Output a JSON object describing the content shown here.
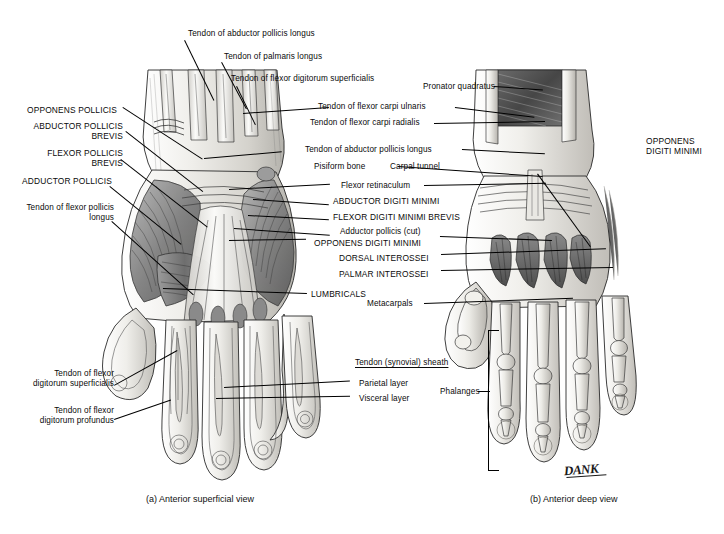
{
  "figure": {
    "signature": "DANK",
    "captions": {
      "a": "(a) Anterior superficial view",
      "b": "(b) Anterior deep view"
    }
  },
  "labels_left_panel": [
    {
      "id": "opponens-pollicis",
      "text": "OPPONENS POLLICIS",
      "style": "caps"
    },
    {
      "id": "abductor-pollicis-brevis",
      "text": "ABDUCTOR POLLICIS BREVIS",
      "style": "caps"
    },
    {
      "id": "flexor-pollicis-brevis",
      "text": "FLEXOR POLLICIS BREVIS",
      "style": "caps"
    },
    {
      "id": "adductor-pollicis",
      "text": "ADDUCTOR POLLICIS",
      "style": "caps"
    },
    {
      "id": "tendon-flexor-pollicis-longus",
      "text": "Tendon of flexor pollicis longus",
      "style": "sentence"
    },
    {
      "id": "tendon-fds",
      "text": "Tendon of flexor digitorum superficialis",
      "style": "sentence"
    },
    {
      "id": "tendon-fdp",
      "text": "Tendon of flexor digitorum profundus",
      "style": "sentence"
    }
  ],
  "labels_top": [
    {
      "id": "tendon-abductor-pollicis-longus-top",
      "text": "Tendon of abductor pollicis longus"
    },
    {
      "id": "tendon-palmaris-longus",
      "text": "Tendon of palmaris longus"
    },
    {
      "id": "tendon-flexor-digitorum-superficialis-top",
      "text": "Tendon of flexor digitorum superficialis"
    }
  ],
  "labels_center": [
    {
      "id": "pronator-quadratus",
      "text": "Pronator quadratus"
    },
    {
      "id": "tendon-flexor-carpi-ulnaris",
      "text": "Tendon of flexor carpi ulnaris"
    },
    {
      "id": "tendon-flexor-carpi-radialis",
      "text": "Tendon of flexor carpi radialis"
    },
    {
      "id": "tendon-abductor-pollicis-longus",
      "text": "Tendon of abductor pollicis longus"
    },
    {
      "id": "pisiform-bone",
      "text": "Pisiform bone"
    },
    {
      "id": "carpal-tunnel",
      "text": "Carpal tunnel"
    },
    {
      "id": "flexor-retinaculum",
      "text": "Flexor retinaculum"
    },
    {
      "id": "abductor-digiti-minimi",
      "text": "ABDUCTOR DIGITI MINIMI"
    },
    {
      "id": "flexor-digiti-minimi-brevis",
      "text": "FLEXOR DIGITI MINIMI BREVIS"
    },
    {
      "id": "adductor-pollicis-cut",
      "text": "Adductor pollicis (cut)"
    },
    {
      "id": "opponens-digiti-minimi-center",
      "text": "OPPONENS DIGITI MINIMI"
    },
    {
      "id": "dorsal-interossei",
      "text": "DORSAL INTEROSSEI"
    },
    {
      "id": "palmar-interossei",
      "text": "PALMAR INTEROSSEI"
    },
    {
      "id": "lumbricals",
      "text": "LUMBRICALS"
    },
    {
      "id": "metacarpals",
      "text": "Metacarpals"
    }
  ],
  "labels_right": [
    {
      "id": "opponens-digiti-minimi-right",
      "text": "OPPONENS DIGITI MINIMI"
    },
    {
      "id": "phalanges",
      "text": "Phalanges"
    }
  ],
  "tendon_sheath_group": {
    "heading": "Tendon (synovial) sheath",
    "items": [
      {
        "id": "parietal-layer",
        "text": "Parietal layer"
      },
      {
        "id": "visceral-layer",
        "text": "Visceral layer"
      }
    ]
  },
  "colors": {
    "ink": "#0a0a0a",
    "paper": "#ffffff",
    "muscle_dark": "#5d5d5d",
    "muscle_mid": "#8f8f8f",
    "muscle_light": "#c9c9c9",
    "bone": "#e6e4df",
    "tendon": "#f2f1ed"
  }
}
